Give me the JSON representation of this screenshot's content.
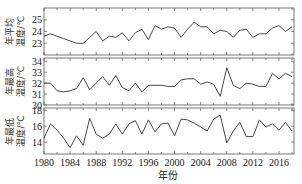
{
  "chart_data": [
    {
      "type": "line",
      "title": "",
      "xlabel": "",
      "ylabel": "年平均温度/℃",
      "ylim": [
        22,
        26
      ],
      "yticks": [
        23,
        24,
        25
      ],
      "x": [
        1980,
        1981,
        1982,
        1983,
        1984,
        1985,
        1986,
        1987,
        1988,
        1989,
        1990,
        1991,
        1992,
        1993,
        1994,
        1995,
        1996,
        1997,
        1998,
        1999,
        2000,
        2001,
        2002,
        2003,
        2004,
        2005,
        2006,
        2007,
        2008,
        2009,
        2010,
        2011,
        2012,
        2013,
        2014,
        2015,
        2016,
        2017,
        2018
      ],
      "values": [
        23.6,
        23.8,
        23.6,
        23.4,
        23.2,
        23.0,
        23.0,
        23.5,
        24.0,
        23.2,
        23.6,
        23.5,
        23.9,
        23.2,
        23.9,
        24.2,
        23.3,
        24.5,
        24.2,
        24.4,
        24.3,
        23.5,
        24.2,
        24.8,
        24.4,
        24.4,
        23.8,
        24.1,
        24.0,
        23.5,
        24.1,
        24.2,
        23.5,
        23.8,
        23.8,
        24.3,
        24.5,
        24.0,
        24.4
      ],
      "grid": false
    },
    {
      "type": "line",
      "title": "",
      "xlabel": "",
      "ylabel": "年最高温度/℃",
      "ylim": [
        30,
        34.3
      ],
      "yticks": [
        30,
        31,
        32,
        33,
        34
      ],
      "x": [
        1980,
        1981,
        1982,
        1983,
        1984,
        1985,
        1986,
        1987,
        1988,
        1989,
        1990,
        1991,
        1992,
        1993,
        1994,
        1995,
        1996,
        1997,
        1998,
        1999,
        2000,
        2001,
        2002,
        2003,
        2004,
        2005,
        2006,
        2007,
        2008,
        2009,
        2010,
        2011,
        2012,
        2013,
        2014,
        2015,
        2016,
        2017,
        2018
      ],
      "values": [
        32.0,
        32.0,
        31.3,
        31.2,
        31.3,
        31.5,
        32.5,
        31.4,
        32.0,
        32.6,
        31.8,
        32.7,
        31.6,
        31.3,
        32.0,
        31.2,
        31.8,
        31.8,
        31.8,
        31.7,
        31.7,
        32.3,
        32.4,
        32.4,
        31.9,
        32.1,
        31.9,
        30.8,
        33.4,
        31.8,
        31.5,
        32.0,
        31.9,
        31.7,
        31.7,
        32.9,
        32.4,
        32.9,
        32.6
      ],
      "grid": false
    },
    {
      "type": "line",
      "title": "",
      "xlabel": "年份",
      "ylabel": "年最低温度/℃",
      "ylim": [
        12.5,
        18.3
      ],
      "yticks": [
        14,
        16,
        18
      ],
      "xticks": [
        1980,
        1984,
        1988,
        1992,
        1996,
        2000,
        2004,
        2008,
        2012,
        2016
      ],
      "x": [
        1980,
        1981,
        1982,
        1983,
        1984,
        1985,
        1986,
        1987,
        1988,
        1989,
        1990,
        1991,
        1992,
        1993,
        1994,
        1995,
        1996,
        1997,
        1998,
        1999,
        2000,
        2001,
        2002,
        2003,
        2004,
        2005,
        2006,
        2007,
        2008,
        2009,
        2010,
        2011,
        2012,
        2013,
        2014,
        2015,
        2016,
        2017,
        2018
      ],
      "values": [
        14.5,
        16.3,
        15.5,
        14.5,
        13.3,
        14.8,
        13.6,
        17.0,
        15.0,
        14.5,
        15.0,
        16.3,
        15.0,
        16.3,
        16.7,
        15.0,
        16.8,
        15.3,
        16.3,
        16.4,
        14.8,
        16.9,
        16.8,
        16.4,
        15.9,
        15.4,
        16.9,
        17.4,
        13.9,
        15.4,
        16.5,
        14.7,
        14.7,
        16.8,
        15.9,
        16.3,
        15.5,
        16.5,
        15.4
      ],
      "grid": false
    }
  ],
  "figure": {
    "xlabel": "年份",
    "panels": [
      {
        "ylabel_line1": "年平均",
        "ylabel_line2": "温度/℃"
      },
      {
        "ylabel_line1": "年最高",
        "ylabel_line2": "温度/℃"
      },
      {
        "ylabel_line1": "年最低",
        "ylabel_line2": "温度/℃"
      }
    ],
    "colors": {
      "line": "#333333",
      "axis": "#555555"
    }
  }
}
